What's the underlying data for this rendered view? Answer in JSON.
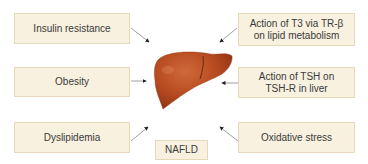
{
  "diagram": {
    "title": "NAFLD",
    "center_label": "NAFLD",
    "center_image": "liver-illustration",
    "colors": {
      "box_fill": "#f8f1df",
      "box_border": "#e6d9b8",
      "liver": "#b5491f",
      "arrow": "#333333",
      "text": "#3a3a3a"
    },
    "factors_left": [
      {
        "label": "Insulin resistance"
      },
      {
        "label": "Obesity"
      },
      {
        "label": "Dyslipidemia"
      }
    ],
    "factors_right": [
      {
        "line1": "Action of T3 via TR-β",
        "line2": "on lipid metabolism"
      },
      {
        "line1": "Action of TSH on",
        "line2": "TSH-R in liver"
      },
      {
        "label": "Oxidative stress"
      }
    ]
  }
}
